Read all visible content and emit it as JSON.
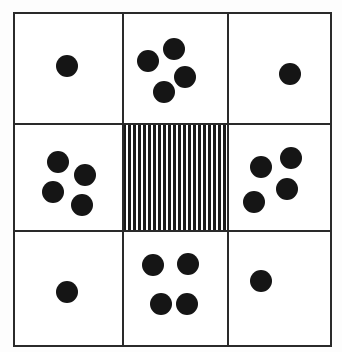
{
  "diagram": {
    "type": "3x3 grid stimulus",
    "colors": {
      "line": "#2a2a2a",
      "dot": "#151515",
      "background": "#ffffff"
    },
    "grid": {
      "x_lines": [
        14,
        123,
        228,
        331
      ],
      "y_lines": [
        13,
        124,
        231,
        346
      ],
      "line_width": 2
    },
    "dot_diameter": 22,
    "cells": [
      {
        "id": "top-left",
        "row": 0,
        "col": 0,
        "dot_count": 1,
        "dots": [
          [
            67,
            66
          ]
        ]
      },
      {
        "id": "top-middle",
        "row": 0,
        "col": 1,
        "dot_count": 4,
        "dots": [
          [
            148,
            61
          ],
          [
            174,
            49
          ],
          [
            185,
            77
          ],
          [
            164,
            92
          ]
        ]
      },
      {
        "id": "top-right",
        "row": 0,
        "col": 2,
        "dot_count": 1,
        "dots": [
          [
            290,
            74
          ]
        ]
      },
      {
        "id": "middle-left",
        "row": 1,
        "col": 0,
        "dot_count": 4,
        "dots": [
          [
            58,
            162
          ],
          [
            85,
            175
          ],
          [
            53,
            192
          ],
          [
            82,
            205
          ]
        ]
      },
      {
        "id": "center",
        "row": 1,
        "col": 1,
        "dot_count": 0,
        "fill": "vertical-stripes",
        "dots": []
      },
      {
        "id": "middle-right",
        "row": 1,
        "col": 2,
        "dot_count": 4,
        "dots": [
          [
            261,
            167
          ],
          [
            291,
            158
          ],
          [
            287,
            189
          ],
          [
            254,
            202
          ]
        ]
      },
      {
        "id": "bottom-left",
        "row": 2,
        "col": 0,
        "dot_count": 1,
        "dots": [
          [
            67,
            292
          ]
        ]
      },
      {
        "id": "bottom-middle",
        "row": 2,
        "col": 1,
        "dot_count": 4,
        "dots": [
          [
            153,
            265
          ],
          [
            188,
            264
          ],
          [
            161,
            304
          ],
          [
            187,
            304
          ]
        ]
      },
      {
        "id": "bottom-right",
        "row": 2,
        "col": 2,
        "dot_count": 1,
        "dots": [
          [
            261,
            281
          ]
        ]
      }
    ]
  }
}
